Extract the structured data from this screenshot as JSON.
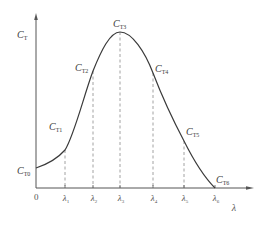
{
  "diagram": {
    "type": "curve-with-markers",
    "colors": {
      "curve": "#3a3a3a",
      "axis": "#555555",
      "dashed": "#8a8a8a",
      "text": "#3a3a3a"
    },
    "axes": {
      "y_label_main": "C",
      "y_label_sub": "T",
      "x_label": "λ",
      "origin": "0"
    },
    "ticks": [
      {
        "main": "λ",
        "sub": "1"
      },
      {
        "main": "λ",
        "sub": "2"
      },
      {
        "main": "λ",
        "sub": "3"
      },
      {
        "main": "λ",
        "sub": "4"
      },
      {
        "main": "λ",
        "sub": "5"
      },
      {
        "main": "λ",
        "sub": "6"
      }
    ],
    "points": [
      {
        "main": "C",
        "sub": "T0"
      },
      {
        "main": "C",
        "sub": "T1"
      },
      {
        "main": "C",
        "sub": "T2"
      },
      {
        "main": "C",
        "sub": "T3"
      },
      {
        "main": "C",
        "sub": "T4"
      },
      {
        "main": "C",
        "sub": "T5"
      },
      {
        "main": "C",
        "sub": "T6"
      }
    ],
    "caption": ""
  }
}
